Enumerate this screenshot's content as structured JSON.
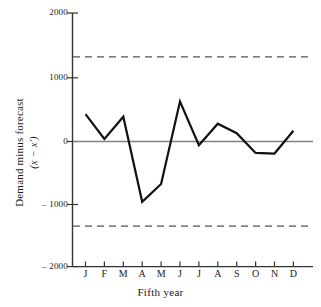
{
  "figure": {
    "background_color": "#ffffff",
    "line_color": "#111111",
    "zero_line_color": "#777777",
    "limit_line_color": "#555555",
    "axis_color": "#333333"
  },
  "axes": {
    "x_title": "Fifth year",
    "y_title_line1": "Demand minus forecast",
    "y_title_line2": "(x − x′)",
    "y_ticks": [
      "2000",
      "1000",
      "0",
      "– 1000",
      "– 2000"
    ],
    "y_tick_values": [
      2000,
      1000,
      0,
      -1000,
      -2000
    ],
    "x_ticks": [
      "J",
      "F",
      "M",
      "A",
      "M",
      "J",
      "J",
      "A",
      "S",
      "O",
      "N",
      "D"
    ]
  },
  "chart_data": {
    "type": "line",
    "title": "",
    "subtitle": "",
    "xlabel": "Fifth year",
    "ylabel": "Demand minus forecast (x − x′)",
    "categories": [
      "J",
      "F",
      "M",
      "A",
      "M",
      "J",
      "J",
      "A",
      "S",
      "O",
      "N",
      "D"
    ],
    "series": [
      {
        "name": "Demand minus forecast",
        "values": [
          430,
          40,
          390,
          -950,
          -670,
          630,
          -60,
          280,
          130,
          -180,
          -190,
          170
        ]
      }
    ],
    "reference_lines": [
      {
        "name": "upper control limit",
        "value": 1333,
        "style": "dashed"
      },
      {
        "name": "zero line",
        "value": 0,
        "style": "solid"
      },
      {
        "name": "lower control limit",
        "value": -1333,
        "style": "dashed"
      }
    ],
    "ylim": [
      -2000,
      2000
    ],
    "yticks": [
      2000,
      1000,
      0,
      -1000,
      -2000
    ],
    "grid": false,
    "legend": "none"
  }
}
